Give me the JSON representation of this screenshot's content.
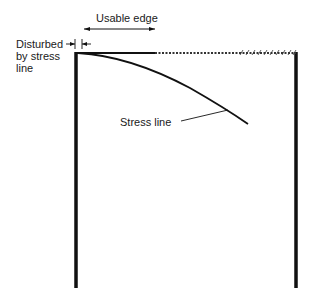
{
  "diagram": {
    "labels": {
      "usable_edge": "Usable edge",
      "disturbed_line1": "Disturbed",
      "disturbed_line2": "by stress",
      "disturbed_line3": "line",
      "stress_line": "Stress line"
    },
    "colors": {
      "ink": "#111111",
      "background": "#ffffff"
    }
  }
}
